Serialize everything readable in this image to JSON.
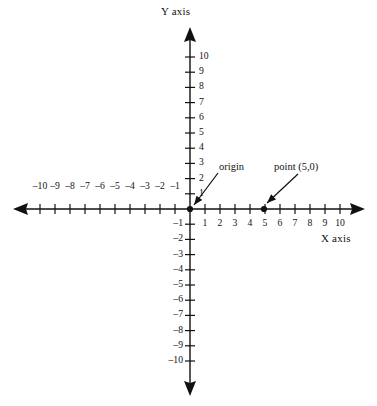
{
  "figure": {
    "type": "coordinate-plane",
    "background_color": "#ffffff",
    "ink_color": "#111111"
  },
  "axes": {
    "x_title": "X axis",
    "y_title": "Y axis",
    "x_range": [
      -10,
      10
    ],
    "y_range": [
      -10,
      10
    ],
    "tick_interval": 1,
    "origin_px": [
      190,
      209
    ],
    "unit_px_x": 15.0,
    "unit_px_y": 15.2,
    "x_negative_labels": [
      "–10",
      "–9",
      "–8",
      "–7",
      "–6",
      "–5",
      "–4",
      "–3",
      "–2",
      "–1"
    ],
    "x_positive_labels": [
      "1",
      "2",
      "3",
      "4",
      "5",
      "6",
      "7",
      "8",
      "9",
      "10"
    ],
    "y_positive_labels": [
      "1",
      "2",
      "3",
      "4",
      "5",
      "6",
      "7",
      "8",
      "9",
      "10"
    ],
    "y_negative_labels": [
      "–1",
      "–2",
      "–3",
      "–4",
      "–5",
      "–6",
      "–7",
      "–8",
      "–9",
      "–10"
    ]
  },
  "annotations": [
    {
      "id": "origin",
      "label": "origin",
      "point": [
        0,
        0
      ],
      "label_px": [
        219,
        163
      ],
      "arrow_from_px": [
        218,
        173
      ],
      "arrow_to_px": [
        194,
        205
      ]
    },
    {
      "id": "point-5-0",
      "label": "point (5,0)",
      "point": [
        5,
        0
      ],
      "label_px": [
        274,
        163
      ],
      "arrow_from_px": [
        298,
        174
      ],
      "arrow_to_px": [
        267,
        203
      ]
    }
  ],
  "plotted_points": [
    {
      "name": "origin-dot",
      "x": 0,
      "y": 0,
      "px": [
        190,
        209
      ]
    },
    {
      "name": "point-5-0-dot",
      "x": 5,
      "y": 0,
      "px": [
        264,
        209
      ]
    }
  ],
  "chart_data": {
    "type": "scatter",
    "title": "",
    "xlabel": "X axis",
    "ylabel": "Y axis",
    "xlim": [
      -10,
      10
    ],
    "ylim": [
      -10,
      10
    ],
    "grid": false,
    "legend": "none",
    "x": [
      0,
      5
    ],
    "y": [
      0,
      0
    ],
    "point_labels": [
      "origin",
      "point (5,0)"
    ],
    "xticks": [
      -10,
      -9,
      -8,
      -7,
      -6,
      -5,
      -4,
      -3,
      -2,
      -1,
      1,
      2,
      3,
      4,
      5,
      6,
      7,
      8,
      9,
      10
    ],
    "yticks": [
      -10,
      -9,
      -8,
      -7,
      -6,
      -5,
      -4,
      -3,
      -2,
      -1,
      1,
      2,
      3,
      4,
      5,
      6,
      7,
      8,
      9,
      10
    ],
    "annotations": [
      "origin",
      "point (5,0)"
    ]
  }
}
